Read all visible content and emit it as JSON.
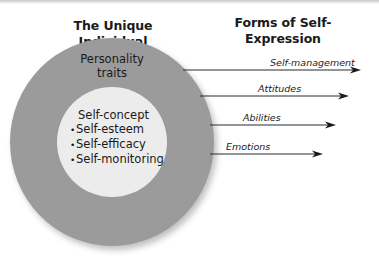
{
  "headings": {
    "left": "The Unique Individual",
    "right_line1": "Forms of Self-",
    "right_line2": "Expression"
  },
  "outer_ring": {
    "label_line1": "Personality",
    "label_line2": "traits",
    "color": "#9b9b9b"
  },
  "inner_circle": {
    "title": "Self-concept",
    "bullets": [
      "Self-esteem",
      "Self-efficacy",
      "Self-monitoring"
    ],
    "bullet_glyph": "•",
    "color": "#ececec"
  },
  "arrows": [
    {
      "label": "Self-management",
      "x1": 183,
      "x2": 361,
      "y": 70,
      "label_x": 270,
      "label_y": 57
    },
    {
      "label": "Attitudes",
      "x1": 200,
      "x2": 349,
      "y": 96,
      "label_x": 258,
      "label_y": 83
    },
    {
      "label": "Abilities",
      "x1": 210,
      "x2": 336,
      "y": 125,
      "label_x": 243,
      "label_y": 112
    },
    {
      "label": "Emotions",
      "x1": 210,
      "x2": 323,
      "y": 154,
      "label_x": 226,
      "label_y": 141
    }
  ]
}
